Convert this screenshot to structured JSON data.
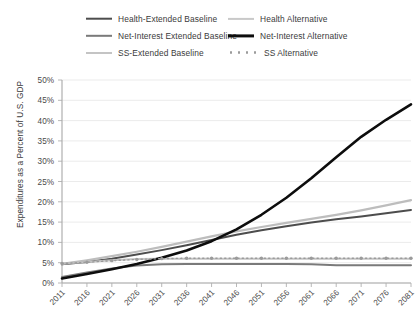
{
  "chart_data": {
    "type": "line",
    "title": "",
    "xlabel": "",
    "ylabel": "Expenditures as a Percent of U.S. GDP",
    "ylim": [
      0,
      50
    ],
    "yticks": [
      "0%",
      "5%",
      "10%",
      "15%",
      "20%",
      "25%",
      "30%",
      "35%",
      "40%",
      "45%",
      "50%"
    ],
    "ytick_values": [
      0,
      5,
      10,
      15,
      20,
      25,
      30,
      35,
      40,
      45,
      50
    ],
    "x": [
      2011,
      2016,
      2021,
      2026,
      2031,
      2036,
      2041,
      2046,
      2051,
      2056,
      2061,
      2066,
      2071,
      2076,
      2081
    ],
    "xticks": [
      "2011",
      "2016",
      "2021",
      "2026",
      "2031",
      "2036",
      "2041",
      "2046",
      "2051",
      "2056",
      "2061",
      "2066",
      "2071",
      "2076",
      "2081"
    ],
    "grid": true,
    "legend_position": "top",
    "series": [
      {
        "name": "Health-Extended Baseline",
        "color": "#4d4d4d",
        "style": "solid",
        "width": 2.0,
        "values": [
          4.6,
          5.2,
          6.0,
          7.0,
          8.1,
          9.3,
          10.6,
          11.9,
          13.0,
          14.0,
          14.9,
          15.7,
          16.4,
          17.2,
          18.0
        ]
      },
      {
        "name": "Net-Interest Extended Baseline",
        "color": "#7a7a7a",
        "style": "solid",
        "width": 2.0,
        "values": [
          1.5,
          2.6,
          3.6,
          4.3,
          4.6,
          4.7,
          4.7,
          4.7,
          4.7,
          4.7,
          4.6,
          4.4,
          4.4,
          4.4,
          4.4
        ]
      },
      {
        "name": "SS-Extended Baseline",
        "color": "#c4c4c4",
        "style": "solid",
        "width": 2.0,
        "values": [
          4.8,
          5.2,
          5.6,
          5.9,
          6.0,
          6.0,
          6.0,
          6.0,
          6.0,
          6.0,
          6.0,
          6.0,
          6.0,
          6.0,
          6.0
        ]
      },
      {
        "name": "Health Alternative",
        "color": "#bdbdbd",
        "style": "solid",
        "width": 2.2,
        "values": [
          4.7,
          5.6,
          6.6,
          7.7,
          8.9,
          10.2,
          11.5,
          12.7,
          13.8,
          14.8,
          15.8,
          16.8,
          17.9,
          19.1,
          20.4
        ]
      },
      {
        "name": "Net-Interest Alternative",
        "color": "#0d0d0d",
        "style": "solid",
        "width": 2.6,
        "values": [
          1.1,
          2.2,
          3.4,
          4.7,
          6.2,
          8.0,
          10.3,
          13.2,
          16.8,
          21.0,
          25.8,
          31.0,
          36.0,
          40.2,
          44.0
        ]
      },
      {
        "name": "SS Alternative",
        "color": "#9b9b9b",
        "style": "dotted",
        "width": 1.4,
        "marker": "dot",
        "values": [
          4.8,
          5.1,
          5.5,
          5.8,
          6.0,
          6.1,
          6.1,
          6.1,
          6.1,
          6.1,
          6.1,
          6.1,
          6.1,
          6.1,
          6.1
        ]
      }
    ]
  },
  "legend": {
    "items": [
      {
        "label": "Health-Extended Baseline",
        "color": "#4d4d4d",
        "style": "solid",
        "thickness": 2.6
      },
      {
        "label": "Health Alternative",
        "color": "#c9c9c9",
        "style": "solid",
        "thickness": 2.2
      },
      {
        "label": "Net-Interest Extended Baseline",
        "color": "#7a7a7a",
        "style": "solid",
        "thickness": 2.4
      },
      {
        "label": "Net-Interest Alternative",
        "color": "#0d0d0d",
        "style": "solid",
        "thickness": 3.2
      },
      {
        "label": "SS-Extended Baseline",
        "color": "#c4c4c4",
        "style": "solid",
        "thickness": 2.0
      },
      {
        "label": "SS Alternative",
        "color": "#9b9b9b",
        "style": "dotted",
        "thickness": 2.0
      }
    ]
  }
}
